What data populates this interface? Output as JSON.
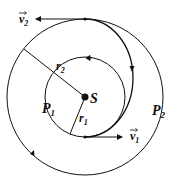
{
  "diagram": {
    "center_label": "S",
    "inner_orbit_label": "P",
    "inner_orbit_sub": "1",
    "outer_orbit_label": "P",
    "outer_orbit_sub": "2",
    "inner_radius_label": "r",
    "inner_radius_sub": "1",
    "outer_radius_label": "r",
    "outer_radius_sub": "2",
    "velocity_1_label": "v",
    "velocity_1_sub": "1",
    "velocity_2_label": "v",
    "velocity_2_sub": "2",
    "line_color": "#111111"
  }
}
